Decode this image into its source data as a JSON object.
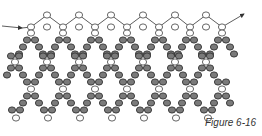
{
  "figure": {
    "caption": "Figure 6-16",
    "colors": {
      "white_bead_fill": "#ffffff",
      "white_bead_stroke": "#555555",
      "gray_bead_fill": "#7a7a7a",
      "gray_bead_stroke": "#333333",
      "thread": "#333333"
    },
    "thread_path": {
      "start_arrow": [
        [
          2,
          26
        ],
        [
          22,
          28
        ]
      ],
      "zigzag": [
        [
          22,
          28
        ],
        [
          31,
          27
        ],
        [
          47,
          15
        ],
        [
          63,
          27
        ],
        [
          79,
          15
        ],
        [
          95,
          27
        ],
        [
          111,
          15
        ],
        [
          127,
          27
        ],
        [
          143,
          15
        ],
        [
          159,
          27
        ],
        [
          175,
          15
        ],
        [
          190,
          27
        ],
        [
          206,
          15
        ],
        [
          222,
          27
        ],
        [
          244,
          14
        ]
      ],
      "end_arrow_tip": [
        244,
        14
      ]
    },
    "valley_columns_x": [
      31,
      63,
      95,
      127,
      159,
      190,
      222
    ],
    "peak_columns_x": [
      47,
      79,
      111,
      143,
      175,
      206
    ],
    "bottom_white_x": [
      16,
      48,
      80,
      112,
      144,
      176,
      208
    ]
  }
}
